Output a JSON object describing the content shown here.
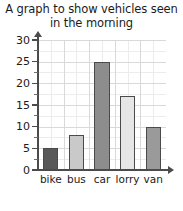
{
  "chart_data": {
    "type": "bar",
    "title": "A graph to show vehicles seen\nin the morning",
    "categories": [
      "bike",
      "bus",
      "car",
      "lorry",
      "van"
    ],
    "values": [
      5,
      8,
      25,
      17,
      10
    ],
    "bar_colors": [
      "#585858",
      "#c9c9c9",
      "#8d8d8d",
      "#e6e6e6",
      "#9a9a9a"
    ],
    "bar_border_color": "#4a4a4a",
    "xlabel": "",
    "ylabel": "",
    "ylim": [
      0,
      30
    ],
    "ytick_labels": [
      "0",
      "5",
      "10",
      "15",
      "20",
      "25",
      "30"
    ],
    "ytick_values": [
      0,
      5,
      10,
      15,
      20,
      25,
      30
    ],
    "yminor_tick_step": 2.5,
    "grid": true,
    "legend": false,
    "axis_color": "#4b4b4b",
    "grid_major_color": "#d9d9da",
    "grid_minor_color": "#ececed",
    "background_color": "#ffffff"
  }
}
